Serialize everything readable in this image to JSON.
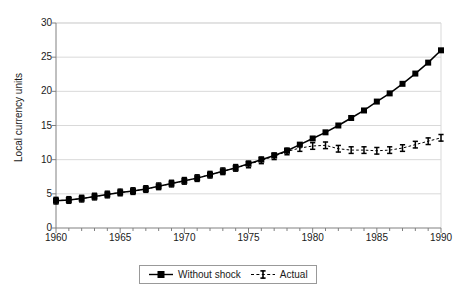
{
  "chart_data": {
    "type": "line",
    "title": "",
    "xlabel": "",
    "ylabel": "Local currency units",
    "xlim": [
      1960,
      1990
    ],
    "ylim": [
      0,
      30
    ],
    "yticks": [
      0,
      5,
      10,
      15,
      20,
      25,
      30
    ],
    "xticks": [
      1960,
      1965,
      1970,
      1975,
      1980,
      1985,
      1990
    ],
    "xtick_minor_step": 1,
    "grid": "horizontal",
    "legend_position": "bottom-center",
    "x": [
      1960,
      1961,
      1962,
      1963,
      1964,
      1965,
      1966,
      1967,
      1968,
      1969,
      1970,
      1971,
      1972,
      1973,
      1974,
      1975,
      1976,
      1977,
      1978,
      1979,
      1980,
      1981,
      1982,
      1983,
      1984,
      1985,
      1986,
      1987,
      1988,
      1989,
      1990
    ],
    "series": [
      {
        "name": "Without shock",
        "marker": "square",
        "linestyle": "solid",
        "color": "#000000",
        "values": [
          4.0,
          4.1,
          4.3,
          4.6,
          4.9,
          5.2,
          5.4,
          5.7,
          6.1,
          6.5,
          6.9,
          7.3,
          7.8,
          8.3,
          8.8,
          9.4,
          10.0,
          10.6,
          11.3,
          12.2,
          13.1,
          14.0,
          15.0,
          16.1,
          17.2,
          18.5,
          19.7,
          21.1,
          22.6,
          24.2,
          26.0
        ]
      },
      {
        "name": "Actual",
        "marker": "ibeam",
        "linestyle": "dashed",
        "color": "#000000",
        "values": [
          4.0,
          4.1,
          4.3,
          4.6,
          4.9,
          5.2,
          5.4,
          5.7,
          6.1,
          6.5,
          6.9,
          7.3,
          7.8,
          8.3,
          8.8,
          9.3,
          9.9,
          10.5,
          11.2,
          11.7,
          12.0,
          12.1,
          11.6,
          11.4,
          11.4,
          11.3,
          11.4,
          11.7,
          12.2,
          12.7,
          13.2
        ]
      }
    ]
  },
  "legend": {
    "items": [
      {
        "label": "Without shock"
      },
      {
        "label": "Actual"
      }
    ]
  },
  "axes": {
    "y_title": "Local currency units"
  },
  "colors": {
    "line": "#000000",
    "grid": "#d9d9d9",
    "axis": "#808080",
    "background": "#ffffff"
  }
}
